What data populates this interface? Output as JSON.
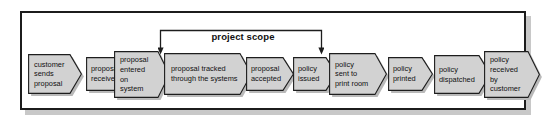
{
  "diagram": {
    "type": "process-flow-chevrons",
    "annotation": {
      "label": "project scope",
      "spans_steps": [
        "proposal tracked through the systems",
        "proposal accepted",
        "policy issued"
      ],
      "start_step_index": 3,
      "end_step_index": 6
    },
    "colors": {
      "shape_fill": "#d2d2d2",
      "shape_stroke": "#1d1d1d",
      "shape_shadow": "#b9b9b9",
      "frame_border": "#1c1c1c",
      "frame_fill": "#ffffff",
      "frame_shadow": "#c8c8c8",
      "text": "#101010"
    },
    "steps": [
      {
        "index": 1,
        "label": "customer sends proposal",
        "lines": [
          "customer",
          "sends",
          "proposal"
        ]
      },
      {
        "index": 2,
        "label": "proposal received",
        "lines": [
          "proposal",
          "received"
        ]
      },
      {
        "index": 3,
        "label": "proposal entered on system",
        "lines": [
          "proposal",
          "entered",
          "on",
          "system"
        ]
      },
      {
        "index": 4,
        "label": "proposal tracked through the systems",
        "lines": [
          "proposal tracked",
          "through the systems"
        ]
      },
      {
        "index": 5,
        "label": "proposal accepted",
        "lines": [
          "proposal",
          "accepted"
        ]
      },
      {
        "index": 6,
        "label": "policy issued",
        "lines": [
          "policy",
          "issued"
        ]
      },
      {
        "index": 7,
        "label": "policy sent to print room",
        "lines": [
          "policy",
          "sent to",
          "print room"
        ]
      },
      {
        "index": 8,
        "label": "policy printed",
        "lines": [
          "policy",
          "printed"
        ]
      },
      {
        "index": 9,
        "label": "policy dispatched",
        "lines": [
          "policy",
          "dispatched"
        ]
      },
      {
        "index": 10,
        "label": "policy received by customer",
        "lines": [
          "policy",
          "received",
          "by",
          "customer"
        ]
      }
    ]
  }
}
